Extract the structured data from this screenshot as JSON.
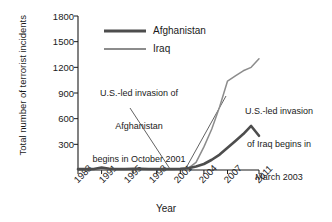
{
  "chart_data": {
    "type": "line",
    "title": "",
    "xlabel": "Year",
    "ylabel": "Total number of terrorist incidents",
    "xlim": [
      1988,
      2011
    ],
    "ylim": [
      0,
      1800
    ],
    "ytick_values": [
      300,
      600,
      900,
      1200,
      1500,
      1800
    ],
    "ytick_labels": [
      "300",
      "600",
      "900",
      "1200",
      "1500",
      "1800"
    ],
    "xtick_values": [
      1988,
      1991,
      1995,
      1998,
      2001,
      2004,
      2007,
      2011
    ],
    "xtick_labels": [
      "1988",
      "1991",
      "1995",
      "1998",
      "2001",
      "2004",
      "2007",
      "2011"
    ],
    "grid": false,
    "legend_position": "top-center",
    "x": [
      1988,
      1989,
      1990,
      1991,
      1992,
      1993,
      1994,
      1995,
      1996,
      1997,
      1998,
      1999,
      2000,
      2001,
      2002,
      2003,
      2004,
      2005,
      2006,
      2007,
      2008,
      2009,
      2010,
      2011
    ],
    "series": [
      {
        "name": "Afghanistan",
        "color": "#4d4d4d",
        "line_width": 2.6,
        "values": [
          10,
          10,
          12,
          30,
          14,
          12,
          12,
          14,
          14,
          12,
          12,
          12,
          12,
          14,
          20,
          40,
          70,
          120,
          180,
          260,
          340,
          420,
          515,
          400
        ]
      },
      {
        "name": "Iraq",
        "color": "#8c8c8c",
        "line_width": 1.5,
        "values": [
          6,
          6,
          6,
          8,
          6,
          6,
          6,
          6,
          6,
          6,
          6,
          6,
          6,
          8,
          20,
          90,
          270,
          480,
          740,
          1040,
          1100,
          1160,
          1200,
          1300
        ]
      }
    ],
    "annotations": [
      {
        "id": "afghanistan-invasion",
        "lines": [
          "U.S.-led invasion of",
          "Afghanistan",
          "begins in October 2001"
        ],
        "points_to_year": 2001
      },
      {
        "id": "iraq-invasion",
        "lines": [
          "U.S.-led invasion",
          "of Iraq begins in",
          "March 2003"
        ],
        "points_to_year": 2003
      }
    ]
  },
  "legend": {
    "items": [
      {
        "label": "Afghanistan"
      },
      {
        "label": "Iraq"
      }
    ]
  },
  "axes": {
    "y_title": "Total number of terrorist incidents",
    "x_title": "Year"
  }
}
